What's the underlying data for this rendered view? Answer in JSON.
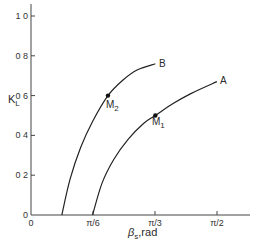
{
  "chart_data": {
    "type": "line",
    "title": "",
    "xlabel": "βs, rad",
    "ylabel": "KL",
    "xlim": [
      0,
      1.75
    ],
    "ylim": [
      0,
      1.0
    ],
    "grid": false,
    "x_ticks": [
      {
        "value": 0,
        "label": "0"
      },
      {
        "value": 0.5236,
        "label": "π/6"
      },
      {
        "value": 1.0472,
        "label": "π/3"
      },
      {
        "value": 1.5708,
        "label": "π/2"
      }
    ],
    "y_ticks": [
      {
        "value": 0,
        "label": "0"
      },
      {
        "value": 0.2,
        "label": "0 2"
      },
      {
        "value": 0.4,
        "label": "0 4"
      },
      {
        "value": 0.6,
        "label": "0 6"
      },
      {
        "value": 0.8,
        "label": "0 8"
      },
      {
        "value": 1.0,
        "label": "1 0"
      }
    ],
    "series": [
      {
        "name": "B",
        "x": [
          0.26,
          0.33,
          0.42,
          0.52,
          0.65,
          0.78,
          0.9,
          1.05
        ],
        "y": [
          0.0,
          0.18,
          0.34,
          0.47,
          0.6,
          0.68,
          0.73,
          0.76
        ]
      },
      {
        "name": "A",
        "x": [
          0.52,
          0.6,
          0.7,
          0.82,
          0.95,
          1.05,
          1.2,
          1.35,
          1.57
        ],
        "y": [
          0.0,
          0.16,
          0.28,
          0.38,
          0.46,
          0.5,
          0.56,
          0.61,
          0.67
        ]
      }
    ],
    "points": [
      {
        "name": "M2",
        "series": "B",
        "x": 0.65,
        "y": 0.6
      },
      {
        "name": "M1",
        "series": "A",
        "x": 1.05,
        "y": 0.5
      }
    ],
    "annotations": [
      "A",
      "B",
      "M1",
      "M2"
    ]
  },
  "labels": {
    "y_axis_main": "K",
    "y_axis_sub": "L",
    "x_axis_main": "β",
    "x_axis_sub": "s",
    "x_axis_unit": ",rad",
    "curve_a": "A",
    "curve_b": "B",
    "m1_main": "M",
    "m1_sub": "1",
    "m2_main": "M",
    "m2_sub": "2",
    "origin_x": "0",
    "origin_y": "0"
  }
}
